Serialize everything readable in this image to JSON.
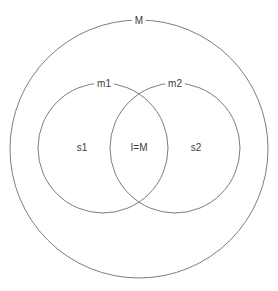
{
  "diagram": {
    "type": "venn-diagram",
    "background_color": "#ffffff",
    "stroke_color": "#7d7d7d",
    "text_color": "#3c3c3c",
    "outer_set": {
      "label": "M",
      "label_position": "top-arc"
    },
    "sets": [
      {
        "label": "m1",
        "label_position": "top-arc"
      },
      {
        "label": "m2",
        "label_position": "top-arc"
      }
    ],
    "regions": [
      {
        "label": "s1",
        "description": "left-only region of m1"
      },
      {
        "label": "I=M",
        "description": "intersection of m1 and m2"
      },
      {
        "label": "s2",
        "description": "right-only region of m2"
      }
    ]
  }
}
